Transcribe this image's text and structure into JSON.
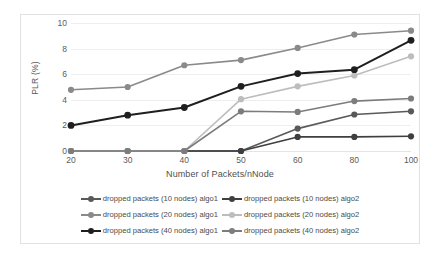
{
  "chart_data": {
    "type": "line",
    "title": "",
    "xlabel": "Number of Packets/nNode",
    "ylabel": "PLR (%)",
    "categories": [
      "20",
      "30",
      "40",
      "50",
      "60",
      "80",
      "100"
    ],
    "x": [
      20,
      30,
      40,
      50,
      60,
      80,
      100
    ],
    "ylim": [
      0,
      10
    ],
    "yticks": [
      "0",
      "2",
      "4",
      "6",
      "8",
      "10"
    ],
    "ytick_values": [
      0,
      2,
      4,
      6,
      8,
      10
    ],
    "grid": true,
    "legend_position": "bottom",
    "series": [
      {
        "name": "dropped packets (10 nodes) algo1",
        "values": [
          0,
          0,
          0,
          0,
          1.75,
          2.85,
          3.1
        ],
        "color": "#595959",
        "width": 1.6,
        "marker": 3.1
      },
      {
        "name": "dropped packets (10 nodes) algo2",
        "values": [
          0,
          0,
          0,
          0,
          1.1,
          1.1,
          1.15
        ],
        "color": "#3f3f3f",
        "width": 1.6,
        "marker": 3.1
      },
      {
        "name": "dropped packets (20 nodes) algo1",
        "values": [
          4.78,
          5.0,
          6.7,
          7.1,
          8.05,
          9.1,
          9.4
        ],
        "color": "#8a8a8a",
        "width": 1.6,
        "marker": 3.1
      },
      {
        "name": "dropped packets (20 nodes) algo2",
        "values": [
          0,
          0,
          0,
          4.05,
          5.05,
          5.9,
          7.4
        ],
        "color": "#bdbdbd",
        "width": 1.6,
        "marker": 3.1
      },
      {
        "name": "dropped packets (40 nodes) algo1",
        "values": [
          2.0,
          2.8,
          3.4,
          5.05,
          6.05,
          6.35,
          8.65
        ],
        "color": "#1f1f1f",
        "width": 2.0,
        "marker": 3.4
      },
      {
        "name": "dropped packets (40 nodes) algo2",
        "values": [
          0,
          0,
          0,
          3.1,
          3.05,
          3.9,
          4.1
        ],
        "color": "#7c7c7c",
        "width": 1.6,
        "marker": 3.1
      }
    ],
    "legend_layout": [
      [
        0,
        1
      ],
      [
        2,
        3
      ],
      [
        4,
        5
      ]
    ]
  }
}
